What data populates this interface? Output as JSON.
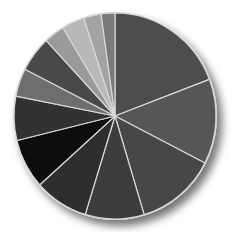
{
  "chart_data": {
    "type": "pie",
    "title": "",
    "legend": null,
    "start_angle_deg": 0,
    "direction": "clockwise",
    "slice_border_color": "#d8d8d8",
    "labels": [
      "Slice 1",
      "Slice 2",
      "Slice 3",
      "Slice 4",
      "Slice 5",
      "Slice 6",
      "Slice 7",
      "Slice 8",
      "Slice 9",
      "Slice 10",
      "Slice 11",
      "Slice 12",
      "Slice 13"
    ],
    "values": [
      19.2,
      13.3,
      12.8,
      9.4,
      8.6,
      7.8,
      6.9,
      4.4,
      5.6,
      3.3,
      3.6,
      2.8,
      2.2
    ],
    "colors": [
      "#4d4d4d",
      "#575757",
      "#474747",
      "#3d3d3d",
      "#2e2e2e",
      "#0a0a0a",
      "#333333",
      "#6e6e6e",
      "#4a4a4a",
      "#9a9a9a",
      "#b8b8b8",
      "#a3a3a3",
      "#7a7a7a"
    ]
  }
}
